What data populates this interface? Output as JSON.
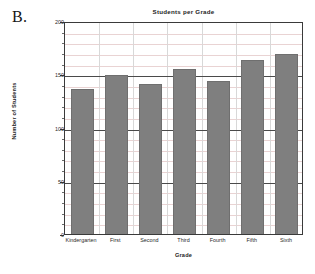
{
  "panel": {
    "label": "B."
  },
  "chart_data": {
    "type": "bar",
    "title": "Students per Grade",
    "xlabel": "Grade",
    "ylabel": "Number of Students",
    "categories": [
      "Kindergarten",
      "First",
      "Second",
      "Third",
      "Fourth",
      "Fifth",
      "Sixth"
    ],
    "values": [
      136,
      149,
      141,
      155,
      144,
      163,
      169
    ],
    "ylim": [
      0,
      200
    ],
    "yticks": [
      0,
      50,
      100,
      150,
      200
    ],
    "ytick_labels": [
      "0",
      "50",
      "100",
      "150",
      "200"
    ],
    "y_minor_step": 10,
    "grid": true,
    "legend": "none",
    "bar_color": "#7f7f7f",
    "grid_color": "#e9d3d3",
    "axis_color": "#3a3a3a"
  }
}
